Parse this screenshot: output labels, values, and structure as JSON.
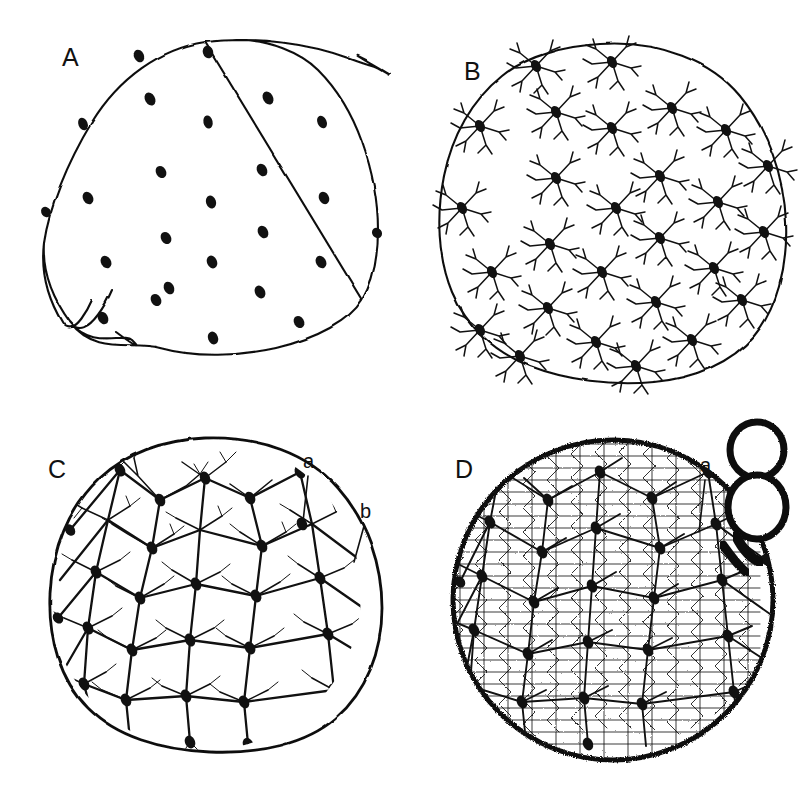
{
  "figure": {
    "kind": "histological-line-drawing-plate",
    "background_color": "#ffffff",
    "ink_color": "#111111",
    "panel_count": 4,
    "panel_layout": "2x2 grid"
  },
  "panels": [
    {
      "id": "A",
      "label": "A",
      "label_x": 62,
      "label_y": 66,
      "stage_description": "round section outline with bare oval cell bodies only, no processes",
      "outline_style": "thin-smooth-polygonal",
      "cell_count": 24,
      "has_branches": false,
      "annotations": []
    },
    {
      "id": "B",
      "label": "B",
      "label_x": 464,
      "label_y": 80,
      "stage_description": "same section with cells bearing short sparse radiating processes",
      "outline_style": "thin-smooth-polygonal",
      "cell_count": 27,
      "has_branches": true,
      "branch_density": "sparse",
      "annotations": []
    },
    {
      "id": "C",
      "label": "C",
      "label_x": 48,
      "label_y": 478,
      "stage_description": "dense interconnected branching network of cells filling the section",
      "outline_style": "irregular-sketchy",
      "cell_count": 30,
      "has_branches": true,
      "branch_density": "dense",
      "annotations": [
        {
          "text": "a",
          "label_x": 310,
          "label_y": 468,
          "leader_to_x": 302,
          "leader_to_y": 520,
          "points_to": "cell-process"
        },
        {
          "text": "b",
          "label_x": 366,
          "label_y": 518,
          "leader_to_x": 356,
          "leader_to_y": 560,
          "points_to": "outer-margin-process"
        }
      ]
    },
    {
      "id": "D",
      "label": "D",
      "label_x": 455,
      "label_y": 478,
      "stage_description": "very dense reticular felt-work mesh with budding daughter cells attached at upper right",
      "outline_style": "fuzzy-stippled",
      "cell_count": 30,
      "has_branches": true,
      "branch_density": "very-dense-reticular",
      "annotations": [
        {
          "text": "a",
          "label_x": 707,
          "label_y": 472,
          "leader_to_x": 700,
          "leader_to_y": 530,
          "points_to": "attachment-stalk"
        }
      ],
      "buds": {
        "count": 2,
        "description": "two pale oval buds with thick dark stippled rims, stacked vertically",
        "fill": "#ffffff",
        "rim_color": "#111111"
      }
    }
  ],
  "labels": {
    "panel_letters": [
      "A",
      "B",
      "C",
      "D"
    ],
    "sub_labels": [
      "a",
      "b"
    ]
  }
}
